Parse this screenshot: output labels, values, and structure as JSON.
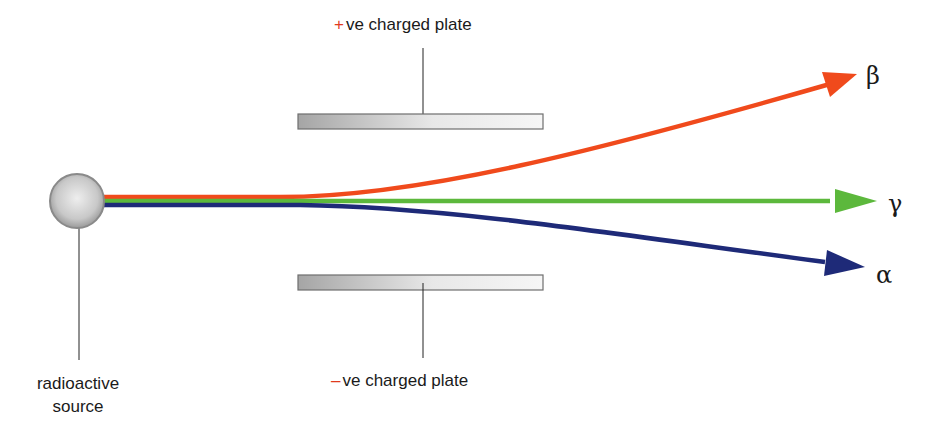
{
  "diagram": {
    "source": {
      "label_line1": "radioactive",
      "label_line2": "source"
    },
    "plates": {
      "top": {
        "sign": "+",
        "label": "ve charged plate"
      },
      "bottom": {
        "sign": "–",
        "label": "ve charged plate"
      }
    },
    "rays": [
      {
        "name": "beta",
        "symbol": "β",
        "color": "#f04a1c",
        "deflection": "towards +ve plate"
      },
      {
        "name": "gamma",
        "symbol": "γ",
        "color": "#5cb83c",
        "deflection": "none"
      },
      {
        "name": "alpha",
        "symbol": "α",
        "color": "#1e2a78",
        "deflection": "towards –ve plate"
      }
    ],
    "colors": {
      "beta": "#f04a1c",
      "gamma": "#5cb83c",
      "alpha": "#1e2a78",
      "plate_fill_dark": "#a9a9a9",
      "plate_fill_light": "#f2f2f2",
      "plate_border": "#6e6e6e",
      "sign_color": "#e03a1e"
    }
  }
}
